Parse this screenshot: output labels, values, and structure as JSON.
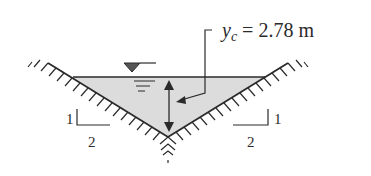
{
  "diagram": {
    "depth_label": {
      "symbol": "y",
      "subscript": "c",
      "equals": " = 2.78 m"
    },
    "left_slope": {
      "rise": "1",
      "run": "2"
    },
    "right_slope": {
      "rise": "1",
      "run": "2"
    },
    "colors": {
      "water": "#dcdcdc",
      "line": "#2a2a2a",
      "background": "#ffffff"
    }
  }
}
